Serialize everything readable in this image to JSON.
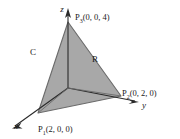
{
  "figure": {
    "background_color": "#ffffff",
    "fill_color": "#a8a8a8",
    "edge_color": "#5a5a5a",
    "axis_color": "#1a1a1a",
    "text_color": "#1a1a1a"
  },
  "axes": [
    {
      "key": "x",
      "label": "x",
      "label_x": 16,
      "label_y": 128,
      "tip_x": 12,
      "tip_y": 124,
      "origin_x": 68,
      "origin_y": 88
    },
    {
      "key": "y",
      "label": "y",
      "label_x": 143,
      "label_y": 108,
      "tip_x": 138,
      "tip_y": 102,
      "origin_x": 68,
      "origin_y": 88
    },
    {
      "key": "z",
      "label": "z",
      "label_x": 63,
      "label_y": 11,
      "tip_x": 68,
      "tip_y": 8,
      "origin_x": 68,
      "origin_y": 88
    }
  ],
  "points": [
    {
      "key": "P1",
      "name": "P",
      "subscript": "1",
      "coords": "(2, 0, 0)",
      "full_label": "P1(2, 0, 0)",
      "vertex_x": 38,
      "vertex_y": 113,
      "label_x": 40,
      "label_y": 131
    },
    {
      "key": "P2",
      "name": "P",
      "subscript": "2",
      "coords": "(0, 2, 0)",
      "full_label": "P2(0, 2, 0)",
      "vertex_x": 121,
      "vertex_y": 96,
      "label_x": 122,
      "label_y": 95
    },
    {
      "key": "P3",
      "name": "P",
      "subscript": "3",
      "coords": "(0, 0, 4)",
      "full_label": "P3(0, 0, 4)",
      "vertex_x": 68,
      "vertex_y": 22,
      "label_x": 75,
      "label_y": 19
    }
  ],
  "annotations": [
    {
      "key": "region",
      "label": "R",
      "x": 95,
      "y": 62
    },
    {
      "key": "curve",
      "label": "C",
      "x": 33,
      "y": 55
    }
  ]
}
